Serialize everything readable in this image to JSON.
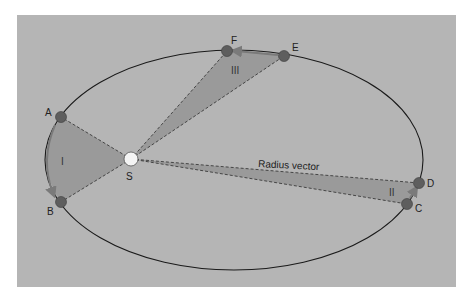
{
  "diagram": {
    "colors": {
      "page_bg": "#ffffff",
      "panel_bg": "#b5b5b5",
      "sector_fill": "#9a9a9a",
      "orbit_stroke": "#1a1a1a",
      "dash_stroke": "#3a3a3a",
      "planet_fill": "#5e5e5e",
      "sun_fill": "#f4f4f4",
      "arrow_color": "#7a7a7a"
    },
    "panel": {
      "x": 17,
      "y": 15,
      "width": 439,
      "height": 272
    },
    "orbit": {
      "cx": 234,
      "cy": 160,
      "rx": 189,
      "ry": 110
    },
    "sun": {
      "label": "S",
      "x": 131,
      "y": 159,
      "r": 7
    },
    "points": [
      {
        "label": "A",
        "x": 61,
        "y": 117
      },
      {
        "label": "B",
        "x": 61,
        "y": 202
      },
      {
        "label": "C",
        "x": 407,
        "y": 204
      },
      {
        "label": "D",
        "x": 419,
        "y": 183
      },
      {
        "label": "E",
        "x": 284,
        "y": 56
      },
      {
        "label": "F",
        "x": 227,
        "y": 51
      }
    ],
    "sectors": [
      {
        "label": "I",
        "from": "A",
        "to": "B"
      },
      {
        "label": "II",
        "from": "C",
        "to": "D"
      },
      {
        "label": "III",
        "from": "E",
        "to": "F"
      }
    ],
    "radius_vector_label": "Radius vector"
  }
}
